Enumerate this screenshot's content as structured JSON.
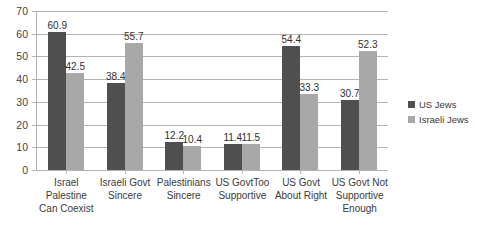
{
  "chart_data": {
    "type": "bar",
    "title": "",
    "xlabel": "",
    "ylabel": "",
    "ylim": [
      0,
      70
    ],
    "ytick_step": 10,
    "grid": true,
    "legend_position": "right",
    "categories": [
      "Israel Palestine Can Coexist",
      "Israeli Govt Sincere",
      "Palestinians Sincere",
      "US GovtToo Supportive",
      "US Govt About Right",
      "US Govt Not Supportive Enough"
    ],
    "category_lines": [
      [
        "Israel",
        "Palestine",
        "Can Coexist"
      ],
      [
        "Israeli Govt",
        "Sincere"
      ],
      [
        "Palestinians",
        "Sincere"
      ],
      [
        "US GovtToo",
        "Supportive"
      ],
      [
        "US Govt",
        "About Right"
      ],
      [
        "US Govt Not",
        "Supportive",
        "Enough"
      ]
    ],
    "yticks": [
      "70",
      "60",
      "50",
      "40",
      "30",
      "20",
      "10",
      "0"
    ],
    "series": [
      {
        "name": "US Jews",
        "color": "#4f4f4f",
        "values": [
          60.9,
          38.4,
          12.2,
          11.4,
          54.4,
          30.7
        ],
        "labels": [
          "60.9",
          "38.4",
          "12.2",
          "11.4",
          "54.4",
          "30.7"
        ]
      },
      {
        "name": "Israeli Jews",
        "color": "#a8a8a8",
        "values": [
          42.5,
          55.7,
          10.4,
          11.5,
          33.3,
          52.3
        ],
        "labels": [
          "42.5",
          "55.7",
          "10.4",
          "11.5",
          "33.3",
          "52.3"
        ]
      }
    ]
  }
}
